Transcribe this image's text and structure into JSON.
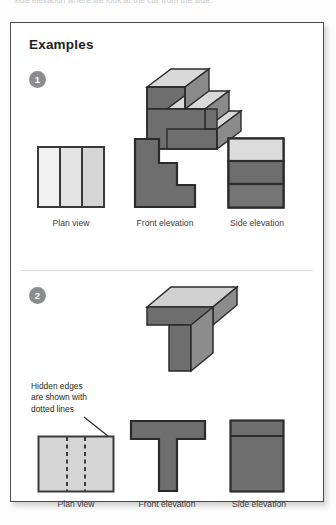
{
  "page": {
    "cut_off_heading": "side elevation where we look at the car from the side.",
    "panel_title": "Examples"
  },
  "colors": {
    "dark_gray": "#6e6e6e",
    "mid_gray": "#777777",
    "light_gray": "#d9d9d9",
    "lighter_gray": "#e8e8e8",
    "pale_gray": "#efefef",
    "outline": "#2b2b2b",
    "badge": "#8a8c8f",
    "panel_border": "#4c4c4c",
    "text": "#231f20"
  },
  "examples": [
    {
      "number": "1",
      "object": "stepped-block-three-steps",
      "views": [
        {
          "name": "plan-view",
          "label": "Plan view",
          "description": "rectangle divided into three vertical strips"
        },
        {
          "name": "front-elevation",
          "label": "Front elevation",
          "description": "descending staircase profile with three steps"
        },
        {
          "name": "side-elevation",
          "label": "Side elevation",
          "description": "rectangle divided into three horizontal bands"
        }
      ]
    },
    {
      "number": "2",
      "object": "t-shaped-block",
      "annotation": "Hidden edges\nare shown with\ndotted lines",
      "views": [
        {
          "name": "plan-view",
          "label": "Plan view",
          "description": "rectangle with two vertical dotted hidden edge lines"
        },
        {
          "name": "front-elevation",
          "label": "Front elevation",
          "description": "T shape"
        },
        {
          "name": "side-elevation",
          "label": "Side elevation",
          "description": "rectangle with thin horizontal band at top"
        }
      ]
    }
  ]
}
